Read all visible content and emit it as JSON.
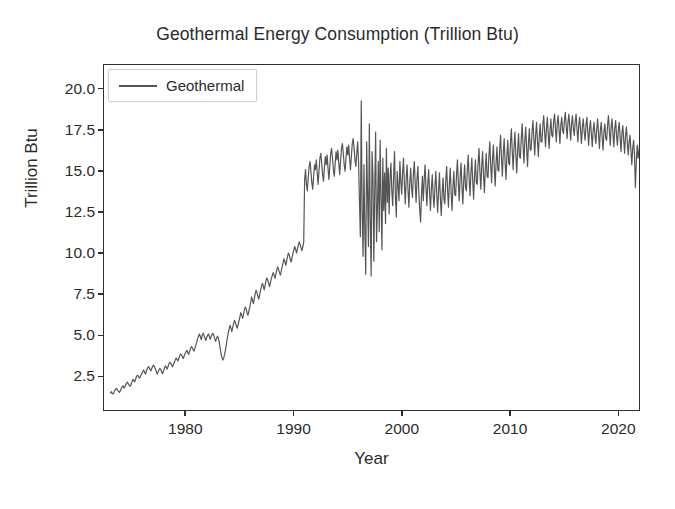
{
  "chart_data": {
    "type": "line",
    "title": "Geothermal Energy Consumption (Trillion Btu)",
    "xlabel": "Year",
    "ylabel": "Trillion Btu",
    "grid": false,
    "legend_position": "upper left",
    "xlim": [
      1972.4,
      1922.0
    ],
    "x_range": [
      1972.4,
      2022.0
    ],
    "ylim": [
      0.4,
      21.5
    ],
    "xticks": [
      1980,
      1990,
      2000,
      2010,
      2020
    ],
    "xtick_labels": [
      "1980",
      "1990",
      "2000",
      "2010",
      "2020"
    ],
    "yticks": [
      2.5,
      5.0,
      7.5,
      10.0,
      12.5,
      15.0,
      17.5,
      20.0
    ],
    "ytick_labels": [
      "2.5",
      "5.0",
      "7.5",
      "10.0",
      "12.5",
      "15.0",
      "17.5",
      "20.0"
    ],
    "series": [
      {
        "name": "Geothermal",
        "color": "#555555",
        "line_width": 1.2,
        "x_start": 1973.0,
        "x_step": 0.0833333,
        "values": [
          1.45,
          1.52,
          1.4,
          1.38,
          1.5,
          1.62,
          1.7,
          1.72,
          1.6,
          1.55,
          1.48,
          1.58,
          1.72,
          1.8,
          1.88,
          1.75,
          1.82,
          1.95,
          2.05,
          2.1,
          1.98,
          1.9,
          1.85,
          1.96,
          2.15,
          2.28,
          2.2,
          2.12,
          2.3,
          2.45,
          2.52,
          2.48,
          2.35,
          2.4,
          2.55,
          2.62,
          2.75,
          2.85,
          2.7,
          2.6,
          2.78,
          2.92,
          3.05,
          3.0,
          2.88,
          2.8,
          2.95,
          3.08,
          3.15,
          3.05,
          2.9,
          2.75,
          2.6,
          2.72,
          2.85,
          2.95,
          2.88,
          2.7,
          2.62,
          2.78,
          2.95,
          3.1,
          3.02,
          2.9,
          3.05,
          3.2,
          3.32,
          3.28,
          3.15,
          3.05,
          3.18,
          3.3,
          3.45,
          3.58,
          3.5,
          3.4,
          3.55,
          3.7,
          3.82,
          3.78,
          3.65,
          3.55,
          3.7,
          3.85,
          3.95,
          4.05,
          3.92,
          3.8,
          3.98,
          4.15,
          4.28,
          4.22,
          4.08,
          4.0,
          4.18,
          4.35,
          4.55,
          4.78,
          4.92,
          5.05,
          4.88,
          4.7,
          4.95,
          5.1,
          4.98,
          4.8,
          4.65,
          4.85,
          4.95,
          5.05,
          4.9,
          4.72,
          4.88,
          5.02,
          5.08,
          4.95,
          4.75,
          4.6,
          4.78,
          4.92,
          4.8,
          4.55,
          4.2,
          3.85,
          3.6,
          3.45,
          3.58,
          3.8,
          4.1,
          4.45,
          4.8,
          5.1,
          5.35,
          5.58,
          5.42,
          5.2,
          5.45,
          5.7,
          5.88,
          5.75,
          5.55,
          5.4,
          5.62,
          5.85,
          6.1,
          6.35,
          6.2,
          6.0,
          6.25,
          6.52,
          6.7,
          6.58,
          6.35,
          6.2,
          6.45,
          6.7,
          7.0,
          7.3,
          7.12,
          6.9,
          7.2,
          7.5,
          7.72,
          7.58,
          7.35,
          7.18,
          7.45,
          7.75,
          7.95,
          8.15,
          7.98,
          7.75,
          8.02,
          8.3,
          8.48,
          8.35,
          8.12,
          7.95,
          8.2,
          8.45,
          8.62,
          8.8,
          8.65,
          8.45,
          8.7,
          8.95,
          9.15,
          9.02,
          8.8,
          8.65,
          8.9,
          9.15,
          9.4,
          9.65,
          9.48,
          9.25,
          9.52,
          9.8,
          10.0,
          9.85,
          9.62,
          9.45,
          9.72,
          9.98,
          10.2,
          10.4,
          10.22,
          10.0,
          10.25,
          10.5,
          10.68,
          10.52,
          10.3,
          10.15,
          10.4,
          10.65,
          14.5,
          15.1,
          14.2,
          13.8,
          14.6,
          15.3,
          15.6,
          15.0,
          14.3,
          13.9,
          14.7,
          15.4,
          15.1,
          15.7,
          14.9,
          14.2,
          15.0,
          15.8,
          16.1,
          15.5,
          14.8,
          14.4,
          15.2,
          15.9,
          15.4,
          16.0,
          15.2,
          14.5,
          15.3,
          16.1,
          16.4,
          15.8,
          15.1,
          14.7,
          15.5,
          16.2,
          15.7,
          16.3,
          15.5,
          14.8,
          15.6,
          16.4,
          16.7,
          16.1,
          15.4,
          15.0,
          15.8,
          16.5,
          16.0,
          16.6,
          15.8,
          15.1,
          15.9,
          16.7,
          17.0,
          16.4,
          15.7,
          15.3,
          16.1,
          16.8,
          15.6,
          13.2,
          11.0,
          19.3,
          12.5,
          9.8,
          15.4,
          11.2,
          8.7,
          16.8,
          13.6,
          10.4,
          17.9,
          12.1,
          8.6,
          16.2,
          14.8,
          9.5,
          13.9,
          17.4,
          10.7,
          12.8,
          15.6,
          11.3,
          16.9,
          13.4,
          10.2,
          15.8,
          12.6,
          14.9,
          11.8,
          16.4,
          13.1,
          15.2,
          12.4,
          14.6,
          15.5,
          13.8,
          12.9,
          14.7,
          16.2,
          13.5,
          12.2,
          15.0,
          14.1,
          13.2,
          15.6,
          14.4,
          13.6,
          14.9,
          15.8,
          14.2,
          13.0,
          14.6,
          15.4,
          13.9,
          12.8,
          14.3,
          15.2,
          14.0,
          13.4,
          14.8,
          15.6,
          14.3,
          13.1,
          14.5,
          15.3,
          13.8,
          12.7,
          11.9,
          13.5,
          14.7,
          13.2,
          14.5,
          15.4,
          14.0,
          12.9,
          14.2,
          15.1,
          13.7,
          12.6,
          13.9,
          14.8,
          13.5,
          12.8,
          14.1,
          15.0,
          13.6,
          12.5,
          13.8,
          14.9,
          13.4,
          12.3,
          13.6,
          14.6,
          13.3,
          13.0,
          14.4,
          15.3,
          13.9,
          12.8,
          14.2,
          15.2,
          13.7,
          12.6,
          14.0,
          15.0,
          13.6,
          13.5,
          14.8,
          15.7,
          14.3,
          13.2,
          14.6,
          15.5,
          14.1,
          13.0,
          14.4,
          15.4,
          14.0,
          13.8,
          15.1,
          16.0,
          14.6,
          13.5,
          14.9,
          15.8,
          14.4,
          13.3,
          14.7,
          15.7,
          14.3,
          14.2,
          15.5,
          16.4,
          15.0,
          13.9,
          15.3,
          16.2,
          14.8,
          13.7,
          15.1,
          16.1,
          14.7,
          14.6,
          15.9,
          16.8,
          15.4,
          14.3,
          15.7,
          16.6,
          15.2,
          14.1,
          15.5,
          16.5,
          15.1,
          15.0,
          16.3,
          17.2,
          15.8,
          14.7,
          16.1,
          17.0,
          15.6,
          14.5,
          15.9,
          16.9,
          15.5,
          15.4,
          16.7,
          17.6,
          16.2,
          15.1,
          16.5,
          17.4,
          16.0,
          14.9,
          16.3,
          17.3,
          15.9,
          15.8,
          17.0,
          17.9,
          16.6,
          15.5,
          16.9,
          17.7,
          16.4,
          15.3,
          16.7,
          17.6,
          16.3,
          16.3,
          17.4,
          18.1,
          17.0,
          16.0,
          17.2,
          18.0,
          16.9,
          15.9,
          17.1,
          17.9,
          16.8,
          16.8,
          17.8,
          18.4,
          17.4,
          16.5,
          17.6,
          18.3,
          17.3,
          16.4,
          17.5,
          18.2,
          17.2,
          17.1,
          18.0,
          18.5,
          17.7,
          16.8,
          17.9,
          18.4,
          17.6,
          16.7,
          17.8,
          18.3,
          17.5,
          17.3,
          18.1,
          18.6,
          17.8,
          17.0,
          18.0,
          18.5,
          17.7,
          16.9,
          17.9,
          18.4,
          17.6,
          17.2,
          18.0,
          18.5,
          17.6,
          16.8,
          17.8,
          18.3,
          17.5,
          16.7,
          17.7,
          18.2,
          17.4,
          16.9,
          17.8,
          18.3,
          17.4,
          16.6,
          17.6,
          18.1,
          17.3,
          16.5,
          17.5,
          18.0,
          17.2,
          16.7,
          17.6,
          18.2,
          17.3,
          16.4,
          17.5,
          18.0,
          17.1,
          16.3,
          17.4,
          17.9,
          17.0,
          16.9,
          17.8,
          18.4,
          17.5,
          16.6,
          17.7,
          18.2,
          17.3,
          16.5,
          17.6,
          18.1,
          17.2,
          16.6,
          17.5,
          18.0,
          17.1,
          16.2,
          17.3,
          17.8,
          16.9,
          16.1,
          17.2,
          17.7,
          16.8,
          16.0,
          16.8,
          17.2,
          16.3,
          15.4,
          16.4,
          16.9,
          16.0,
          14.0,
          15.6,
          16.6,
          15.8,
          16.2,
          17.0,
          17.5,
          16.6,
          15.8,
          16.8,
          17.3,
          16.4,
          15.6,
          16.7,
          17.2,
          16.5,
          16.4,
          17.1,
          17.6,
          16.8,
          16.0,
          17.0
        ]
      }
    ]
  },
  "legend": {
    "label": "Geothermal"
  }
}
